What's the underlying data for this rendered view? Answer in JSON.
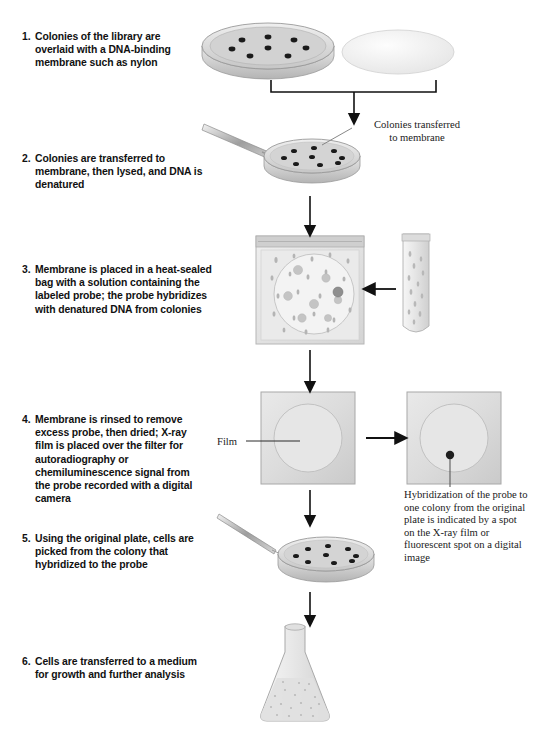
{
  "figure": {
    "steps": [
      {
        "num": "1.",
        "text": "Colonies of the library are overlaid with a DNA-binding membrane such as nylon"
      },
      {
        "num": "2.",
        "text": "Colonies are transferred to membrane, then lysed, and DNA is denatured"
      },
      {
        "num": "3.",
        "text": "Membrane is placed in a heat-sealed bag with a solution containing the labeled probe; the probe hybridizes with denatured DNA from colonies"
      },
      {
        "num": "4.",
        "text": "Membrane is rinsed to remove excess probe, then dried; X-ray film is placed over the filter for autoradiography or chemiluminescence signal from the probe recorded with a digital camera"
      },
      {
        "num": "5.",
        "text": "Using the original plate, cells are picked from the colony that hybridized to the probe"
      },
      {
        "num": "6.",
        "text": "Cells are transferred to a medium for growth and further analysis"
      }
    ],
    "annotations": {
      "colonies_transferred": "Colonies transferred\nto membrane",
      "film": "Film",
      "hybridization": "Hybridization of the probe to one colony from the original plate is indicated by a spot on the X-ray film or fluorescent spot on a digital image"
    },
    "illustrations": {
      "petri_dish_1": "petri-dish-with-colonies",
      "membrane_disc": "nylon-membrane-disc",
      "petri_dish_2": "petri-dish-with-forceps",
      "sealed_bag": "heat-sealed-bag-with-membrane",
      "probe_tube": "test-tube-labeled-probe",
      "film_blank": "x-ray-film-over-filter",
      "film_spot": "x-ray-film-with-hybridization-spot",
      "petri_dish_3": "petri-dish-with-picking-needle",
      "flask": "erlenmeyer-flask-culture"
    },
    "colors": {
      "colony": "#1a1a1a",
      "dish_rim": "#d8d8d8",
      "dish_face": "#c9c9c9",
      "film": "#dcdcdc",
      "arrow": "#111111"
    },
    "counts": {
      "colonies_dish_1": 8,
      "colonies_dish_2": 9,
      "colonies_dish_3": 9,
      "hybridization_spots": 1
    }
  }
}
